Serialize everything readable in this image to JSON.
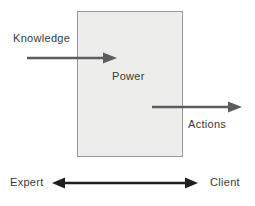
{
  "diagram": {
    "box_label": "Power",
    "input_label": "Knowledge",
    "output_label": "Actions",
    "left_role": "Expert",
    "right_role": "Client"
  },
  "colors": {
    "background": "#ffffff",
    "box_fill": "#ededec",
    "box_border": "#999999",
    "flow_arrow": "#5d5d5d",
    "relation_arrow": "#1e1e1e",
    "text": "#3a3a3a"
  }
}
